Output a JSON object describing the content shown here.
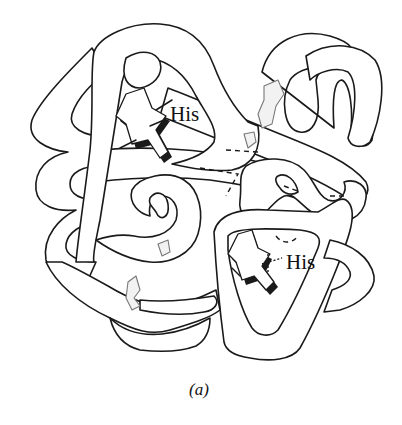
{
  "figure": {
    "type": "protein-tube-diagram",
    "labels": {
      "his_upper": "His",
      "his_lower": "His"
    },
    "caption": "(a)",
    "colors": {
      "stroke": "#1a1a1a",
      "fill": "#ffffff",
      "background": "#ffffff"
    }
  }
}
